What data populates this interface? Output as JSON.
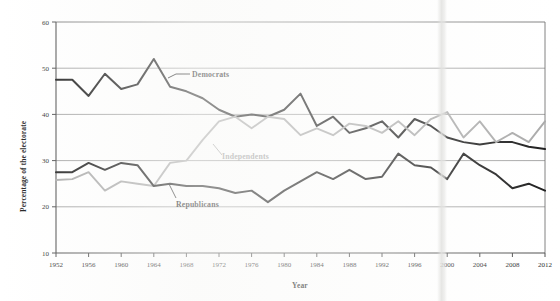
{
  "chart_data": {
    "type": "line",
    "title": "",
    "xlabel": "Year",
    "ylabel": "Percentage of the electorate",
    "xlim": [
      1952,
      2012
    ],
    "ylim": [
      10,
      60
    ],
    "xticks": [
      1952,
      1956,
      1960,
      1964,
      1968,
      1972,
      1976,
      1980,
      1984,
      1988,
      1992,
      1996,
      2000,
      2004,
      2008,
      2012
    ],
    "yticks": [
      10,
      20,
      30,
      40,
      50,
      60
    ],
    "xtick_labels": [
      "1952",
      "1956",
      "1960",
      "1964",
      "1968",
      "1972",
      "1976",
      "1980",
      "1984",
      "1988",
      "1992",
      "1996",
      "2000",
      "2004",
      "2008",
      "2012"
    ],
    "ytick_labels": [
      "10",
      "20",
      "30",
      "40",
      "50",
      "60"
    ],
    "grid": "horizontal",
    "legend": "inline-annotations",
    "x": [
      1952,
      1954,
      1956,
      1958,
      1960,
      1962,
      1964,
      1966,
      1968,
      1970,
      1972,
      1974,
      1976,
      1978,
      1980,
      1982,
      1984,
      1986,
      1988,
      1990,
      1992,
      1994,
      1996,
      1998,
      2000,
      2002,
      2004,
      2006,
      2008,
      2010,
      2012
    ],
    "series": [
      {
        "name": "Democrats",
        "color": "#1a1a1a",
        "values": [
          47.5,
          47.5,
          44.0,
          48.8,
          45.5,
          46.5,
          52.0,
          46.0,
          45.0,
          43.5,
          41.0,
          39.5,
          40.0,
          39.5,
          41.0,
          44.5,
          37.5,
          39.5,
          36.0,
          37.0,
          38.5,
          35.0,
          39.0,
          37.5,
          35.0,
          34.0,
          33.5,
          34.0,
          34.0,
          33.0,
          32.5
        ]
      },
      {
        "name": "Independents",
        "color": "#a8a8a8",
        "values": [
          25.8,
          26.0,
          27.5,
          23.5,
          25.5,
          25.0,
          24.5,
          29.5,
          30.0,
          34.5,
          38.5,
          39.5,
          37.0,
          39.5,
          39.0,
          35.5,
          37.0,
          35.5,
          38.0,
          37.5,
          36.0,
          38.5,
          35.5,
          39.0,
          40.5,
          35.0,
          38.5,
          34.0,
          36.0,
          34.0,
          38.5
        ]
      },
      {
        "name": "Republicans",
        "color": "#1a1a1a",
        "values": [
          27.5,
          27.5,
          29.5,
          28.0,
          29.5,
          29.0,
          24.5,
          25.0,
          24.5,
          24.5,
          24.0,
          23.0,
          23.5,
          21.0,
          23.5,
          25.5,
          27.5,
          26.0,
          28.0,
          26.0,
          26.5,
          31.5,
          29.0,
          28.5,
          26.0,
          31.5,
          29.0,
          27.0,
          24.0,
          25.0,
          23.5
        ]
      }
    ],
    "annotations": [
      {
        "name": "Democrats",
        "text": "Democrats"
      },
      {
        "name": "Independents",
        "text": "Independents"
      },
      {
        "name": "Republicans",
        "text": "Republicans"
      }
    ]
  },
  "axis": {
    "y_title": "Percentage of the electorate",
    "x_title": "Year"
  }
}
